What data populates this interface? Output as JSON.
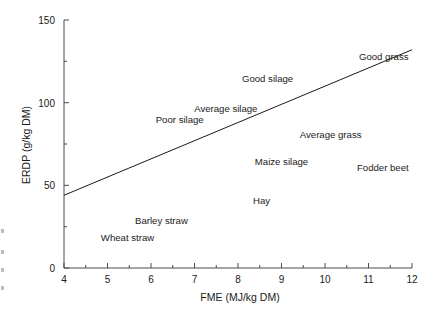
{
  "chart_data": {
    "type": "scatter",
    "title": "",
    "subtitle": "",
    "xlabel": "FME (MJ/kg DM)",
    "ylabel": "ERDP (g/kg DM)",
    "xlim": [
      4,
      12
    ],
    "ylim": [
      0,
      150
    ],
    "x_major_ticks": [
      4,
      5,
      6,
      7,
      8,
      9,
      10,
      11,
      12
    ],
    "x_tick_labels": [
      "4",
      "5",
      "6",
      "7",
      "8",
      "9",
      "10",
      "11",
      "12"
    ],
    "x_minor_ticks": [
      4.5,
      5.5,
      6.5,
      7.5,
      8.5,
      9.5,
      10.5,
      11.5
    ],
    "y_major_ticks": [
      0,
      50,
      100,
      150
    ],
    "y_tick_labels": [
      "0",
      "50",
      "100",
      "150"
    ],
    "y_minor_ticks": [
      25,
      75,
      125
    ],
    "grid": false,
    "legend": "none",
    "annotations": [
      {
        "label": "Good grass",
        "x": 11.35,
        "y": 128
      },
      {
        "label": "Good silage",
        "x": 8.68,
        "y": 115
      },
      {
        "label": "Average silage",
        "x": 7.72,
        "y": 97
      },
      {
        "label": "Poor silage",
        "x": 6.66,
        "y": 90
      },
      {
        "label": "Average grass",
        "x": 10.13,
        "y": 81
      },
      {
        "label": "Maize silage",
        "x": 9.0,
        "y": 65
      },
      {
        "label": "Fodder beet",
        "x": 11.33,
        "y": 61
      },
      {
        "label": "Hay",
        "x": 8.54,
        "y": 41
      },
      {
        "label": "Barley straw",
        "x": 6.24,
        "y": 29
      },
      {
        "label": "Wheat straw",
        "x": 5.46,
        "y": 19
      }
    ],
    "series": [
      {
        "name": "trend line",
        "type": "line",
        "x": [
          4,
          12
        ],
        "values": [
          44,
          132
        ]
      }
    ],
    "line_color": "#1a1a1a",
    "axis_color": "#4a4a4a",
    "background_color": "#ffffff"
  }
}
